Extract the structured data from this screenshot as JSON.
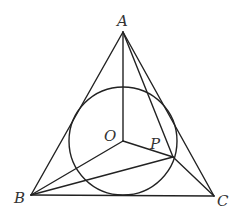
{
  "diagram": {
    "type": "geometry",
    "colors": {
      "stroke": "#222222",
      "label": "#333333",
      "background": "#ffffff"
    },
    "points": {
      "A": {
        "label": "A",
        "x": 123,
        "y": 32
      },
      "B": {
        "label": "B",
        "x": 31,
        "y": 195
      },
      "C": {
        "label": "C",
        "x": 214,
        "y": 196
      },
      "O": {
        "label": "O",
        "x": 123,
        "y": 141
      },
      "P": {
        "label": "P",
        "x": 173,
        "y": 157
      }
    },
    "circle": {
      "center": "O",
      "cx": 123,
      "cy": 141,
      "r": 54
    },
    "segments": [
      [
        "A",
        "B"
      ],
      [
        "B",
        "C"
      ],
      [
        "C",
        "A"
      ],
      [
        "O",
        "A"
      ],
      [
        "O",
        "B"
      ],
      [
        "O",
        "P"
      ],
      [
        "A",
        "P"
      ],
      [
        "B",
        "P"
      ],
      [
        "P",
        "C"
      ]
    ],
    "labels": [
      {
        "text": "A",
        "x": 117,
        "y": 26
      },
      {
        "text": "B",
        "x": 14,
        "y": 203
      },
      {
        "text": "C",
        "x": 217,
        "y": 206
      },
      {
        "text": "O",
        "x": 104,
        "y": 141
      },
      {
        "text": "P",
        "x": 150,
        "y": 149
      }
    ]
  }
}
